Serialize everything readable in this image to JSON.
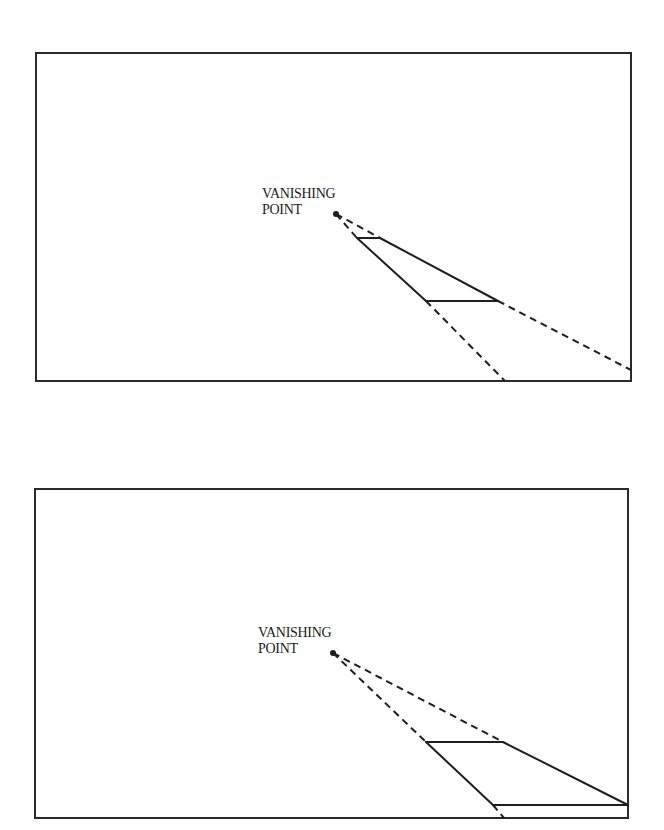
{
  "diagram": {
    "panels": [
      {
        "id": "panel-1",
        "label_line1": "VANISHING",
        "label_line2": "POINT",
        "frame": {
          "x1": 36,
          "y1": 53,
          "x2": 631,
          "y2": 381
        },
        "vanishing_point": {
          "x": 336,
          "y": 214
        },
        "description": "Near trapezoid: short far edge close to vanishing point, longer near edge mid-frame; dashed extensions run to frame edges"
      },
      {
        "id": "panel-2",
        "label_line1": "VANISHING",
        "label_line2": "POINT",
        "frame": {
          "x1": 35,
          "y1": 489,
          "x2": 628,
          "y2": 818
        },
        "vanishing_point": {
          "x": 333,
          "y": 653
        },
        "description": "Trapezoid moved toward viewer: dashed lines from vanishing point to far edge, solid trapezoid near bottom-right of frame"
      }
    ],
    "colors": {
      "line": "#1e1e1e",
      "background": "#ffffff"
    }
  }
}
